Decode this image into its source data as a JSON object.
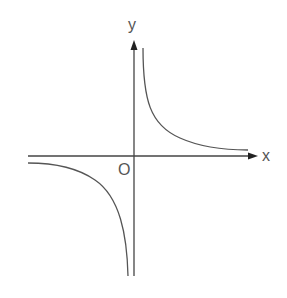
{
  "diagram": {
    "type": "function-graph",
    "axes": {
      "x_label": "x",
      "y_label": "y",
      "origin_label": "O"
    },
    "colors": {
      "axis": "#444444",
      "curve": "#555555",
      "label": "#555555"
    }
  }
}
